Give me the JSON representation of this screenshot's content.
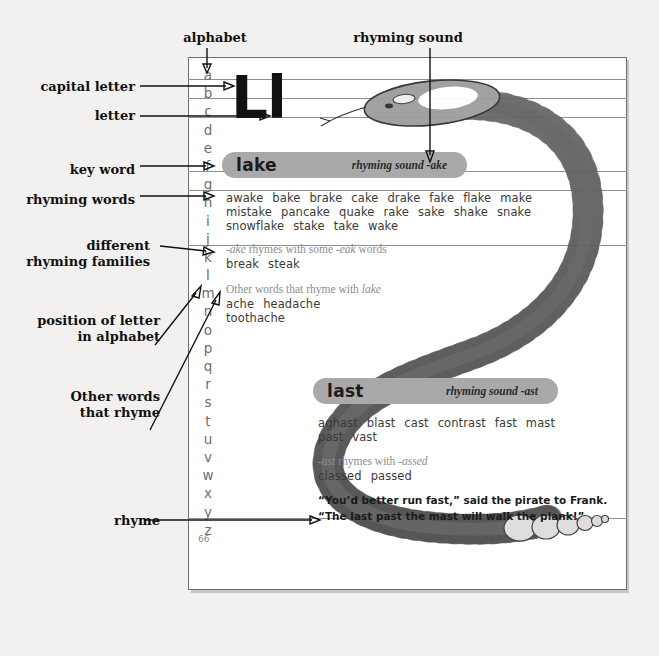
{
  "page": {
    "number": "66",
    "letter_upper": "L",
    "letter_lower": "l",
    "letter_pair": "Ll",
    "alphabet": [
      "a",
      "b",
      "c",
      "d",
      "e",
      "f",
      "g",
      "h",
      "i",
      "j",
      "k",
      "l",
      "m",
      "n",
      "o",
      "p",
      "q",
      "r",
      "s",
      "t",
      "u",
      "v",
      "w",
      "x",
      "y",
      "z"
    ]
  },
  "annotations": [
    {
      "id": "alphabet",
      "label": "alphabet"
    },
    {
      "id": "rhyming-sound",
      "label": "rhyming sound"
    },
    {
      "id": "capital-letter",
      "label": "capital letter"
    },
    {
      "id": "letter",
      "label": "letter"
    },
    {
      "id": "key-word",
      "label": "key word"
    },
    {
      "id": "rhyming-words",
      "label": "rhyming words"
    },
    {
      "id": "different-families",
      "label": "different\nrhyming families"
    },
    {
      "id": "position-of-letter",
      "label": "position of letter\nin alphabet"
    },
    {
      "id": "other-words",
      "label": "Other words\nthat rhyme"
    },
    {
      "id": "rhyme",
      "label": "rhyme"
    }
  ],
  "entries": [
    {
      "key_word": "lake",
      "rhyming_sound": "rhyming sound -ake",
      "rhyming_words": [
        [
          "awake",
          "bake",
          "brake",
          "cake",
          "drake",
          "fake",
          "flake",
          "make"
        ],
        [
          "mistake",
          "pancake",
          "quake",
          "rake",
          "sake",
          "shake",
          "snake"
        ],
        [
          "snowflake",
          "stake",
          "take",
          "wake"
        ]
      ],
      "family_note_prefix": "-ake",
      "family_note_middle": " rhymes with some ",
      "family_note_suffix": "-eak",
      "family_note_end": " words",
      "family_words": [
        "break",
        "steak"
      ],
      "other_note_prefix": "Other words that rhyme with ",
      "other_note_word": "lake",
      "other_words": [
        [
          "ache",
          "headache"
        ],
        [
          "toothache"
        ]
      ]
    },
    {
      "key_word": "last",
      "rhyming_sound": "rhyming sound -ast",
      "rhyming_words": [
        [
          "aghast",
          "blast",
          "cast",
          "contrast",
          "fast",
          "mast"
        ],
        [
          "past",
          "vast"
        ]
      ],
      "family_note_prefix": "-ast",
      "family_note_middle": " rhymes with ",
      "family_note_suffix": "-assed",
      "family_note_end": "",
      "family_words": [
        "classed",
        "passed"
      ],
      "rhyme_lines": [
        "“You’d better run fast,” said the pirate to Frank.",
        "“The last past the mast will walk the plank!”"
      ]
    }
  ],
  "colors": {
    "background": "#f2f1ef",
    "page": "#ffffff",
    "banner": "#a9a9a9",
    "alphabet_text": "#6e6e6e",
    "word_text": "#3a3a3a",
    "note_text": "#8d8d8d",
    "annotation_text": "#111111",
    "snake_dark": "#6e6e6e",
    "snake_light": "#d8d8d8"
  },
  "illustration": {
    "name": "snake-illustration",
    "subject": "snake"
  }
}
